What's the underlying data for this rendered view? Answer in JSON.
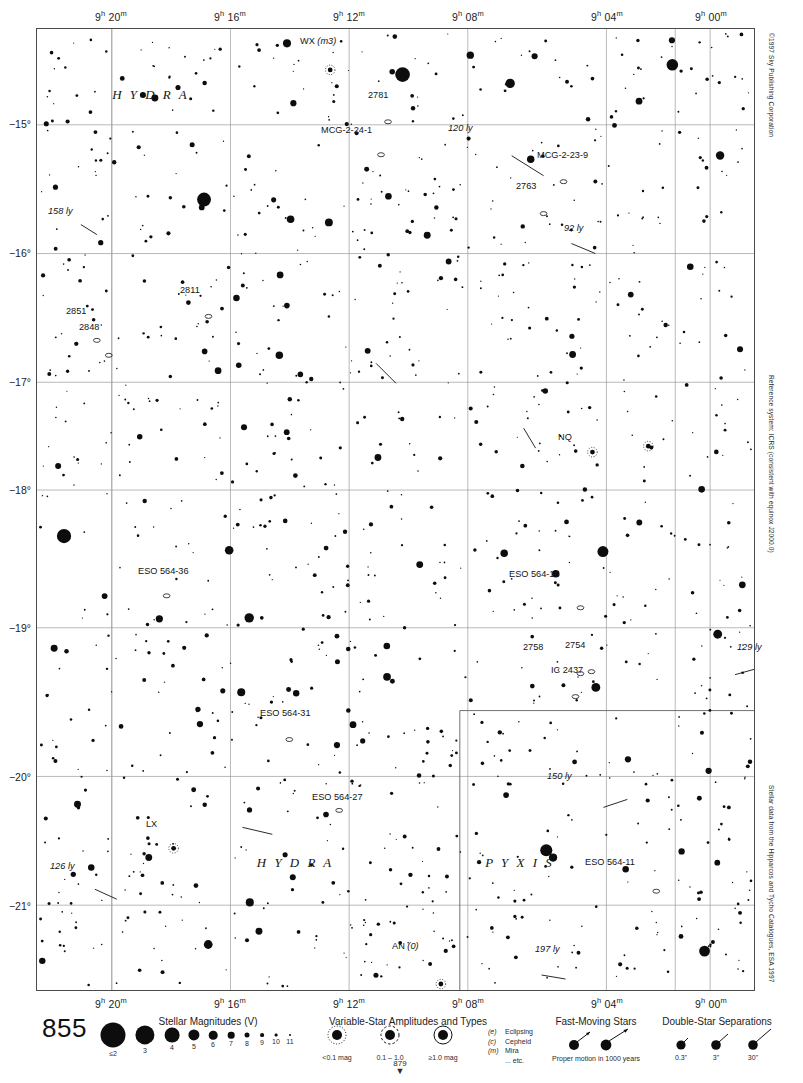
{
  "chart": {
    "number": "855",
    "next_page": "879",
    "constellations": [
      {
        "name": "H Y D R A",
        "x": 150,
        "y": 98
      },
      {
        "name": "H Y D R A",
        "x": 295,
        "y": 868
      },
      {
        "name": "P Y X I S",
        "x": 520,
        "y": 868
      }
    ],
    "credits": {
      "copyright": "©1997 Sky Publishing Corporation",
      "reference": "Reference system: ICRS (consistent with equinox J2000.0)",
      "source": "Stellar data from the Hipparcos and Tycho Catalogues, ESA 1997"
    }
  },
  "axes": {
    "ra_ticks": [
      {
        "label": "9h 20m",
        "h": "9",
        "m": "20",
        "x": 111
      },
      {
        "label": "9h 16m",
        "h": "9",
        "m": "16",
        "x": 230
      },
      {
        "label": "9h 12m",
        "h": "9",
        "m": "12",
        "x": 349
      },
      {
        "label": "9h 08m",
        "h": "9",
        "m": "08",
        "x": 468
      },
      {
        "label": "9h 04m",
        "h": "9",
        "m": "04",
        "x": 607
      },
      {
        "label": "9h 00m",
        "h": "9",
        "m": "00",
        "x": 711
      }
    ],
    "dec_ticks": [
      {
        "label": "−15°",
        "y": 124
      },
      {
        "label": "−16°",
        "y": 253
      },
      {
        "label": "−17°",
        "y": 382
      },
      {
        "label": "−18°",
        "y": 490
      },
      {
        "label": "−19°",
        "y": 628
      },
      {
        "label": "−20°",
        "y": 777
      },
      {
        "label": "−21°",
        "y": 906
      }
    ]
  },
  "labels": [
    {
      "text": "WX (m3)",
      "x": 300,
      "y": 41,
      "italic_part": "(m3)",
      "kind": "variable-star"
    },
    {
      "text": "2781",
      "x": 368,
      "y": 95,
      "kind": "galaxy"
    },
    {
      "text": "MCG-2-24-1",
      "x": 321,
      "y": 130,
      "kind": "galaxy"
    },
    {
      "text": "120 ly",
      "x": 448,
      "y": 128,
      "kind": "distance"
    },
    {
      "text": "MCG-2-23-9",
      "x": 537,
      "y": 155,
      "kind": "galaxy"
    },
    {
      "text": "2763",
      "x": 516,
      "y": 186,
      "kind": "galaxy"
    },
    {
      "text": "92 ly",
      "x": 564,
      "y": 228,
      "kind": "distance"
    },
    {
      "text": "158 ly",
      "x": 48,
      "y": 211,
      "kind": "distance"
    },
    {
      "text": "2811",
      "x": 180,
      "y": 290,
      "kind": "galaxy"
    },
    {
      "text": "2851",
      "x": 66,
      "y": 311,
      "kind": "galaxy"
    },
    {
      "text": "2848",
      "x": 79,
      "y": 327,
      "kind": "galaxy"
    },
    {
      "text": "NQ",
      "x": 558,
      "y": 437,
      "kind": "variable-star"
    },
    {
      "text": "ESO 564-36",
      "x": 138,
      "y": 571,
      "kind": "galaxy"
    },
    {
      "text": "ESO 564-15",
      "x": 509,
      "y": 574,
      "kind": "galaxy"
    },
    {
      "text": "2758",
      "x": 523,
      "y": 647,
      "kind": "galaxy"
    },
    {
      "text": "2754",
      "x": 565,
      "y": 645,
      "kind": "galaxy"
    },
    {
      "text": "IC 2437",
      "x": 551,
      "y": 670,
      "kind": "galaxy"
    },
    {
      "text": "129 ly",
      "x": 737,
      "y": 647,
      "kind": "distance"
    },
    {
      "text": "ESO 564-31",
      "x": 260,
      "y": 713,
      "kind": "galaxy"
    },
    {
      "text": "150 ly",
      "x": 547,
      "y": 776,
      "kind": "distance"
    },
    {
      "text": "ESO 564-27",
      "x": 312,
      "y": 797,
      "kind": "galaxy"
    },
    {
      "text": "LX",
      "x": 146,
      "y": 824,
      "kind": "variable-star"
    },
    {
      "text": "ESO 564-11",
      "x": 585,
      "y": 862,
      "kind": "galaxy"
    },
    {
      "text": "126 ly",
      "x": 50,
      "y": 866,
      "kind": "distance"
    },
    {
      "text": "AN (0)",
      "x": 392,
      "y": 946,
      "italic_part": "(0)",
      "kind": "variable-star"
    },
    {
      "text": "197 ly",
      "x": 535,
      "y": 949,
      "kind": "distance"
    }
  ],
  "legend": {
    "magnitudes": {
      "title": "Stellar Magnitudes (V)",
      "title_x": 208,
      "title_y": 1016,
      "steps": [
        {
          "label": "≤2",
          "x": 113,
          "r": 12.5
        },
        {
          "label": "3",
          "x": 145,
          "r": 9.6
        },
        {
          "label": "4",
          "x": 172,
          "r": 7.4
        },
        {
          "label": "5",
          "x": 194,
          "r": 5.6
        },
        {
          "label": "6",
          "x": 213,
          "r": 4.3
        },
        {
          "label": "7",
          "x": 231,
          "r": 3.3
        },
        {
          "label": "8",
          "x": 247,
          "r": 2.5
        },
        {
          "label": "9",
          "x": 262,
          "r": 1.9
        },
        {
          "label": "10",
          "x": 276,
          "r": 1.4
        },
        {
          "label": "11",
          "x": 290,
          "r": 1.0
        }
      ]
    },
    "variables": {
      "title": "Variable-Star Amplitudes and Types",
      "title_x": 408,
      "title_y": 1016,
      "items": [
        {
          "label": "<0.1 mag",
          "x": 337,
          "ring": "dotted"
        },
        {
          "label": "0.1 – 1.0",
          "x": 390,
          "ring": "dashed"
        },
        {
          "label": "≥1.0 mag",
          "x": 443,
          "ring": "solid"
        }
      ],
      "types": [
        {
          "code": "(e)",
          "name": "Eclipsing"
        },
        {
          "code": "(c)",
          "name": "Cepheid"
        },
        {
          "code": "(m)",
          "name": "Mira"
        },
        {
          "code": "",
          "name": "... etc."
        }
      ]
    },
    "fast_moving": {
      "title": "Fast-Moving Stars",
      "title_x": 596,
      "title_y": 1016,
      "caption": "Proper motion in 1000 years",
      "caption_x": 596,
      "caption_y": 1055
    },
    "double_stars": {
      "title": "Double-Star Separations",
      "title_x": 717,
      "title_y": 1016,
      "items": [
        {
          "label": "0.3\"",
          "x": 681
        },
        {
          "label": "3\"",
          "x": 716
        },
        {
          "label": "30\"",
          "x": 753
        }
      ]
    }
  }
}
